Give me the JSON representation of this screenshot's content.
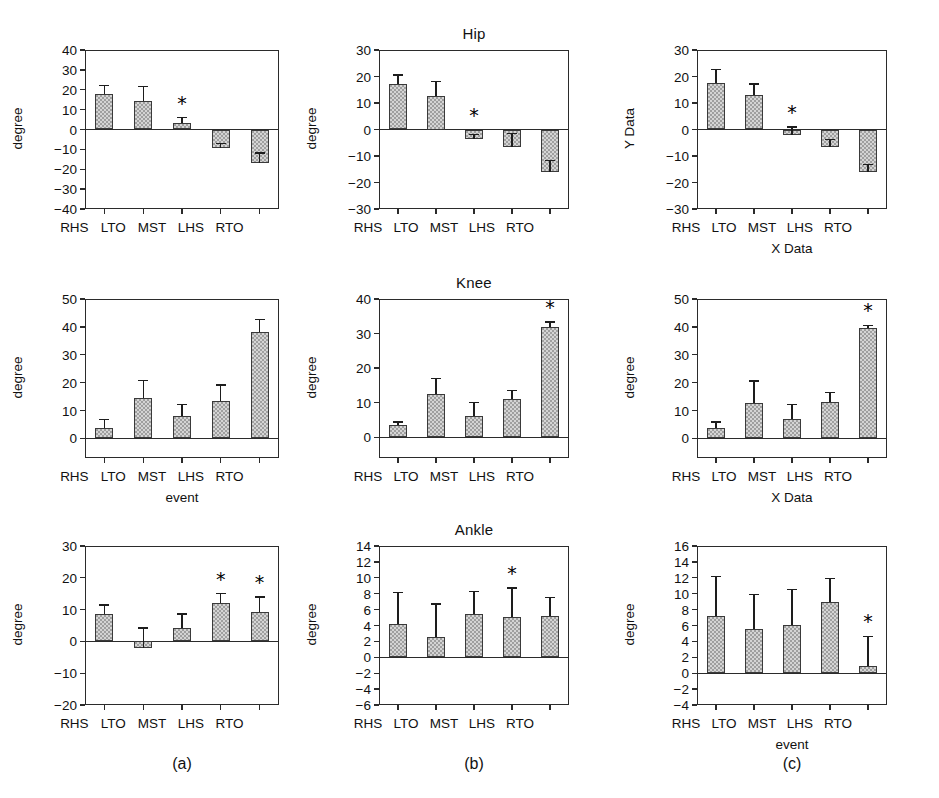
{
  "figure": {
    "column_letters": [
      "(a)",
      "(b)",
      "(c)"
    ],
    "categories": [
      "RHS",
      "LTO",
      "MST",
      "LHS",
      "RTO"
    ],
    "significance_marker": "*"
  },
  "chart_data": [
    {
      "id": "hip-a",
      "type": "bar",
      "title": "",
      "row": "Hip",
      "column": "(a)",
      "xlabel": "",
      "ylabel": "degree",
      "categories": [
        "RHS",
        "LTO",
        "MST",
        "LHS",
        "RTO"
      ],
      "values": [
        18.0,
        14.5,
        3.4,
        -9.5,
        -17.0
      ],
      "errors": [
        4.0,
        7.0,
        2.6,
        2.6,
        5.2
      ],
      "significant": [
        false,
        false,
        true,
        false,
        false
      ],
      "ylim": [
        -40,
        40
      ],
      "yticks": [
        -40,
        -30,
        -20,
        -10,
        0,
        10,
        20,
        30,
        40
      ],
      "grid": false
    },
    {
      "id": "hip-b",
      "type": "bar",
      "title": "Hip",
      "row": "Hip",
      "column": "(b)",
      "xlabel": "",
      "ylabel": "degree",
      "categories": [
        "RHS",
        "LTO",
        "MST",
        "LHS",
        "RTO"
      ],
      "values": [
        17.0,
        12.5,
        -3.6,
        -6.6,
        -16.2
      ],
      "errors": [
        3.6,
        5.6,
        1.6,
        5.2,
        4.6
      ],
      "significant": [
        false,
        false,
        true,
        false,
        false
      ],
      "ylim": [
        -30,
        30
      ],
      "yticks": [
        -30,
        -20,
        -10,
        0,
        10,
        20,
        30
      ],
      "grid": false
    },
    {
      "id": "hip-c",
      "type": "bar",
      "title": "",
      "row": "Hip",
      "column": "(c)",
      "xlabel": "X Data",
      "ylabel": "Y Data",
      "categories": [
        "RHS",
        "LTO",
        "MST",
        "LHS",
        "RTO"
      ],
      "values": [
        17.6,
        13.2,
        -1.9,
        -6.6,
        -16.2
      ],
      "errors": [
        5.0,
        3.9,
        2.8,
        2.8,
        3.0
      ],
      "significant": [
        false,
        false,
        true,
        false,
        false
      ],
      "ylim": [
        -30,
        30
      ],
      "yticks": [
        -30,
        -20,
        -10,
        0,
        10,
        20,
        30
      ],
      "grid": false
    },
    {
      "id": "knee-a",
      "type": "bar",
      "title": "",
      "row": "Knee",
      "column": "(a)",
      "xlabel": "event",
      "ylabel": "degree",
      "categories": [
        "RHS",
        "LTO",
        "MST",
        "LHS",
        "RTO"
      ],
      "values": [
        3.9,
        14.6,
        8.1,
        13.5,
        38.0
      ],
      "errors": [
        2.8,
        6.2,
        4.0,
        5.6,
        4.6
      ],
      "significant": [
        false,
        false,
        false,
        false,
        false
      ],
      "ylim": [
        -7,
        50
      ],
      "yticks": [
        0,
        10,
        20,
        30,
        40,
        50
      ],
      "grid": false
    },
    {
      "id": "knee-b",
      "type": "bar",
      "title": "Knee",
      "row": "Knee",
      "column": "(b)",
      "xlabel": "",
      "ylabel": "degree",
      "categories": [
        "RHS",
        "LTO",
        "MST",
        "LHS",
        "RTO"
      ],
      "values": [
        3.5,
        12.4,
        6.1,
        11.2,
        31.8
      ],
      "errors": [
        0.9,
        4.6,
        4.0,
        2.4,
        1.6
      ],
      "significant": [
        false,
        false,
        false,
        false,
        true
      ],
      "ylim": [
        -6,
        40
      ],
      "yticks": [
        0,
        10,
        20,
        30,
        40
      ],
      "grid": false
    },
    {
      "id": "knee-c",
      "type": "bar",
      "title": "",
      "row": "Knee",
      "column": "(c)",
      "xlabel": "X Data",
      "ylabel": "degree",
      "categories": [
        "RHS",
        "LTO",
        "MST",
        "LHS",
        "RTO"
      ],
      "values": [
        3.7,
        12.6,
        7.0,
        13.2,
        39.7
      ],
      "errors": [
        2.2,
        8.0,
        5.2,
        3.2,
        0.9
      ],
      "significant": [
        false,
        false,
        false,
        false,
        true
      ],
      "ylim": [
        -7,
        50
      ],
      "yticks": [
        0,
        10,
        20,
        30,
        40,
        50
      ],
      "grid": false
    },
    {
      "id": "ankle-a",
      "type": "bar",
      "title": "",
      "row": "Ankle",
      "column": "(a)",
      "xlabel": "",
      "ylabel": "degree",
      "categories": [
        "RHS",
        "LTO",
        "MST",
        "LHS",
        "RTO"
      ],
      "values": [
        8.7,
        -2.2,
        4.2,
        12.2,
        9.1
      ],
      "errors": [
        2.8,
        6.4,
        4.4,
        2.8,
        4.8
      ],
      "significant": [
        false,
        false,
        false,
        true,
        true
      ],
      "ylim": [
        -20,
        30
      ],
      "yticks": [
        -20,
        -10,
        0,
        10,
        20,
        30
      ],
      "grid": false
    },
    {
      "id": "ankle-b",
      "type": "bar",
      "title": "Ankle",
      "row": "Ankle",
      "column": "(b)",
      "xlabel": "",
      "ylabel": "degree",
      "categories": [
        "RHS",
        "LTO",
        "MST",
        "LHS",
        "RTO"
      ],
      "values": [
        4.25,
        2.6,
        5.45,
        5.1,
        5.2
      ],
      "errors": [
        3.9,
        4.1,
        2.8,
        3.6,
        2.3
      ],
      "significant": [
        false,
        false,
        false,
        true,
        false
      ],
      "ylim": [
        -6,
        14
      ],
      "yticks": [
        -6,
        -4,
        -2,
        0,
        2,
        4,
        6,
        8,
        10,
        12,
        14
      ],
      "grid": false
    },
    {
      "id": "ankle-c",
      "type": "bar",
      "title": "",
      "row": "Ankle",
      "column": "(c)",
      "xlabel": "event",
      "ylabel": "degree",
      "categories": [
        "RHS",
        "LTO",
        "MST",
        "LHS",
        "RTO"
      ],
      "values": [
        7.2,
        5.6,
        6.1,
        8.9,
        0.85
      ],
      "errors": [
        5.0,
        4.3,
        4.4,
        3.0,
        3.8
      ],
      "significant": [
        false,
        false,
        false,
        false,
        true
      ],
      "ylim": [
        -4,
        16
      ],
      "yticks": [
        -4,
        -2,
        0,
        2,
        4,
        6,
        8,
        10,
        12,
        14,
        16
      ],
      "grid": false
    }
  ]
}
